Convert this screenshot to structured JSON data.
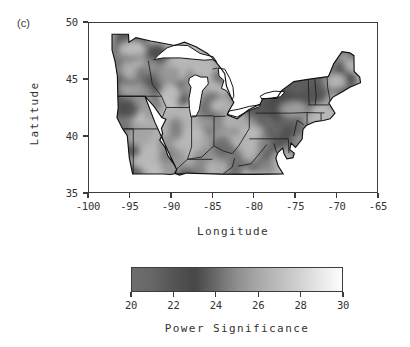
{
  "figure": {
    "panel_label": "(c)"
  },
  "chart_data": {
    "type": "heatmap",
    "title": "",
    "xlabel": "Longitude",
    "ylabel": "Latitude",
    "xlim": [
      -100,
      -65
    ],
    "ylim": [
      35,
      50
    ],
    "xticks": [
      -100,
      -95,
      -90,
      -85,
      -80,
      -75,
      -70,
      -65
    ],
    "xticklabels": [
      "-100",
      "-95",
      "-90",
      "-85",
      "-80",
      "-75",
      "-70",
      "-65"
    ],
    "yticks": [
      35,
      40,
      45,
      50
    ],
    "yticklabels": [
      "35",
      "40",
      "45",
      "50"
    ],
    "grid": false,
    "legend_position": "below",
    "colorbar": {
      "label": "Power Significance",
      "vmin": 20,
      "vmax": 30,
      "ticks": [
        20,
        22,
        24,
        26,
        28,
        30
      ],
      "ticklabels": [
        "20",
        "22",
        "24",
        "26",
        "28",
        "30"
      ],
      "colormap": "grayscale-dark-to-light",
      "stops": [
        {
          "value": 20,
          "color": "#6e6e6e"
        },
        {
          "value": 21,
          "color": "#666666"
        },
        {
          "value": 22,
          "color": "#545454"
        },
        {
          "value": 23,
          "color": "#474747"
        },
        {
          "value": 24,
          "color": "#6a6a6a"
        },
        {
          "value": 25,
          "color": "#8e8e8e"
        },
        {
          "value": 26,
          "color": "#a8a8a8"
        },
        {
          "value": 27,
          "color": "#bdbdbd"
        },
        {
          "value": 28,
          "color": "#d2d2d2"
        },
        {
          "value": 29,
          "color": "#e9e9e9"
        },
        {
          "value": 30,
          "color": "#fdfdfd"
        }
      ]
    },
    "region": "Midwest and Northeastern United States",
    "background_value_color": "#b8b8b8",
    "water_color": "#ffffff",
    "outline_color": "#1a1a1a",
    "field_patches": [
      {
        "lon": -95.0,
        "lat": 47.8,
        "value": 23.5,
        "radius": 1.8
      },
      {
        "lon": -93.6,
        "lat": 46.2,
        "value": 23.0,
        "radius": 1.5
      },
      {
        "lon": -91.8,
        "lat": 46.4,
        "value": 23.2,
        "radius": 1.4
      },
      {
        "lon": -96.2,
        "lat": 45.2,
        "value": 23.4,
        "radius": 1.3
      },
      {
        "lon": -94.0,
        "lat": 44.2,
        "value": 23.6,
        "radius": 1.6
      },
      {
        "lon": -91.0,
        "lat": 44.0,
        "value": 23.3,
        "radius": 1.5
      },
      {
        "lon": -89.4,
        "lat": 44.6,
        "value": 23.1,
        "radius": 1.7
      },
      {
        "lon": -96.0,
        "lat": 42.4,
        "value": 23.5,
        "radius": 1.5
      },
      {
        "lon": -93.2,
        "lat": 41.6,
        "value": 25.5,
        "radius": 1.4
      },
      {
        "lon": -90.0,
        "lat": 41.0,
        "value": 26.5,
        "radius": 1.6
      },
      {
        "lon": -87.2,
        "lat": 40.0,
        "value": 26.8,
        "radius": 1.7
      },
      {
        "lon": -85.0,
        "lat": 42.0,
        "value": 24.2,
        "radius": 1.5
      },
      {
        "lon": -84.2,
        "lat": 40.4,
        "value": 23.8,
        "radius": 1.4
      },
      {
        "lon": -82.4,
        "lat": 41.4,
        "value": 24.0,
        "radius": 1.5
      },
      {
        "lon": -80.6,
        "lat": 40.6,
        "value": 23.6,
        "radius": 1.4
      },
      {
        "lon": -78.6,
        "lat": 41.8,
        "value": 23.4,
        "radius": 1.6
      },
      {
        "lon": -76.4,
        "lat": 42.6,
        "value": 23.2,
        "radius": 1.5
      },
      {
        "lon": -74.6,
        "lat": 43.8,
        "value": 23.0,
        "radius": 1.6
      },
      {
        "lon": -72.4,
        "lat": 44.4,
        "value": 23.4,
        "radius": 1.3
      },
      {
        "lon": -70.2,
        "lat": 45.4,
        "value": 24.5,
        "radius": 1.4
      },
      {
        "lon": -69.0,
        "lat": 45.0,
        "value": 23.2,
        "radius": 1.2
      },
      {
        "lon": -75.4,
        "lat": 40.6,
        "value": 23.8,
        "radius": 1.3
      },
      {
        "lon": -77.6,
        "lat": 38.6,
        "value": 23.5,
        "radius": 1.2
      },
      {
        "lon": -80.0,
        "lat": 38.4,
        "value": 24.0,
        "radius": 1.3
      },
      {
        "lon": -83.0,
        "lat": 37.4,
        "value": 24.2,
        "radius": 1.4
      },
      {
        "lon": -86.0,
        "lat": 37.4,
        "value": 25.0,
        "radius": 1.3
      },
      {
        "lon": -89.6,
        "lat": 37.4,
        "value": 25.5,
        "radius": 1.3
      }
    ]
  }
}
